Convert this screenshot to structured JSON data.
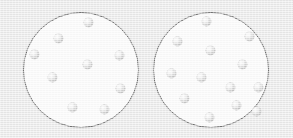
{
  "figure": {
    "kind": "two-petri-dish-dot-density-comparison",
    "background_color": "#e9e9e9",
    "dish_fill_color": "#fbfbfb",
    "dish_border_color": "#6f6f6f",
    "dot_color": "#d2d2d2",
    "dot_highlight_color": "#fdfdfd",
    "dot_shadow_color": "#a6a6a6",
    "dot_diameter": 9
  },
  "chart_data": {
    "type": "scatter",
    "title": "",
    "xlabel": "",
    "ylabel": "",
    "groups": [
      {
        "name": "left-dish",
        "label": "Left circle",
        "count": 9,
        "circle": {
          "cx": 81,
          "cy": 70,
          "r": 58
        },
        "points": [
          {
            "x": 87,
            "y": 21
          },
          {
            "x": 57,
            "y": 37
          },
          {
            "x": 33,
            "y": 53
          },
          {
            "x": 86,
            "y": 63
          },
          {
            "x": 51,
            "y": 76
          },
          {
            "x": 118,
            "y": 54
          },
          {
            "x": 119,
            "y": 87
          },
          {
            "x": 71,
            "y": 106
          },
          {
            "x": 103,
            "y": 108
          }
        ]
      },
      {
        "name": "right-dish",
        "label": "Right circle",
        "count": 13,
        "circle": {
          "cx": 211,
          "cy": 70,
          "r": 58
        },
        "points": [
          {
            "x": 205,
            "y": 20
          },
          {
            "x": 176,
            "y": 40
          },
          {
            "x": 248,
            "y": 35
          },
          {
            "x": 209,
            "y": 49
          },
          {
            "x": 241,
            "y": 63
          },
          {
            "x": 170,
            "y": 72
          },
          {
            "x": 200,
            "y": 76
          },
          {
            "x": 229,
            "y": 86
          },
          {
            "x": 257,
            "y": 86
          },
          {
            "x": 183,
            "y": 97
          },
          {
            "x": 235,
            "y": 104
          },
          {
            "x": 208,
            "y": 116
          },
          {
            "x": 255,
            "y": 110
          }
        ]
      }
    ]
  }
}
